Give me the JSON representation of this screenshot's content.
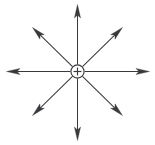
{
  "figure": {
    "title": "Electric field of a positive point charge",
    "width": 155,
    "height": 145,
    "background_color": "#ffffff",
    "stroke_color": "#3a3a3e"
  },
  "charge": {
    "label": "+",
    "sign": "positive",
    "center_x": 77.5,
    "center_y": 71.5,
    "radius": 6.6,
    "fill_color": "#ffffff",
    "stroke_color": "#3a3a3e"
  },
  "chart_data": {
    "type": "scatter",
    "title": "Electric field of a positive point charge",
    "xlabel": "",
    "ylabel": "",
    "center": [
      77.5,
      71.5
    ],
    "field_lines": [
      {
        "name": "north",
        "angle_deg": 90,
        "length": 67,
        "tip_x": 77.5,
        "tip_y": 4.5,
        "direction": "outward"
      },
      {
        "name": "northeast",
        "angle_deg": 45,
        "length": 61,
        "tip_x": 122.5,
        "tip_y": 27.5,
        "direction": "outward"
      },
      {
        "name": "east",
        "angle_deg": 0,
        "length": 72,
        "tip_x": 149.5,
        "tip_y": 71.5,
        "direction": "outward"
      },
      {
        "name": "southeast",
        "angle_deg": -45,
        "length": 61,
        "tip_x": 122.5,
        "tip_y": 115.5,
        "direction": "outward"
      },
      {
        "name": "south",
        "angle_deg": -90,
        "length": 69,
        "tip_x": 77.5,
        "tip_y": 140.5,
        "direction": "outward"
      },
      {
        "name": "southwest",
        "angle_deg": -135,
        "length": 61,
        "tip_x": 32.5,
        "tip_y": 115.5,
        "direction": "outward"
      },
      {
        "name": "west",
        "angle_deg": 180,
        "length": 71,
        "tip_x": 6.5,
        "tip_y": 71.5,
        "direction": "outward"
      },
      {
        "name": "northwest",
        "angle_deg": 135,
        "length": 61,
        "tip_x": 32.5,
        "tip_y": 27.5,
        "direction": "outward"
      }
    ],
    "legend": [],
    "annotations": [
      "+"
    ],
    "grid": false
  }
}
